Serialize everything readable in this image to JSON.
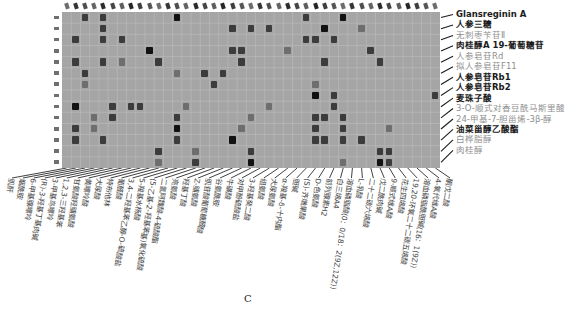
{
  "panel_label": "C",
  "chart_data": {
    "type": "heatmap",
    "title": "",
    "grid": true,
    "colors": {
      "plot_bg": "#a5a5a5",
      "grid_line": "#b9b9b9",
      "tick_mark": "#1f1f1f",
      "row_label_dark": "#1b1b1b",
      "row_label_gray": "#8f8f8f",
      "cell_intensity": {
        "1": "#6e6e6e",
        "2": "#3c3c3c",
        "3": "#121212"
      }
    },
    "rows": 14,
    "cols": 41,
    "row_labels": [
      {
        "text": "Glansreginin A",
        "shade": "dark"
      },
      {
        "text": "人参三糖",
        "shade": "dark"
      },
      {
        "text": "无刺枣苄苷Ⅱ",
        "shade": "gray"
      },
      {
        "text": "肉桂醇A 19-葡萄糖苷",
        "shade": "dark"
      },
      {
        "text": "人参皂苷Rd",
        "shade": "gray"
      },
      {
        "text": "拟人参皂苷F11",
        "shade": "gray"
      },
      {
        "text": "人参皂苷Rb1",
        "shade": "dark"
      },
      {
        "text": "人参皂苷Rb2",
        "shade": "dark"
      },
      {
        "text": "麦珠子酸",
        "shade": "dark"
      },
      {
        "text": "3-O-顺式对香豆酰马斯里酸",
        "shade": "gray"
      },
      {
        "text": "24-甲基-7-胆甾烯-3β-醇",
        "shade": "gray"
      },
      {
        "text": "油菜甾醇乙酸酯",
        "shade": "dark"
      },
      {
        "text": "白桦脂醇",
        "shade": "gray"
      },
      {
        "text": "肉桂醇",
        "shade": "gray"
      }
    ],
    "col_labels": [
      "肌酐",
      "烟酰胺",
      "6-甲基腺嘌呤",
      "(R)-3-羟基丁基肉碱",
      "3-甲基鸟嘌呤",
      "1,2,3-三羟基苯",
      "甘氨酸羟脯氨酸",
      "黄嘌呤酸",
      "犬尿酸",
      "特布他林",
      "葡醛酸",
      "3,4-二羟基苯乙醇-O-硫酸盐",
      "5-羧基水杨酸",
      "(5-乙基-2-羟基苯基)氧化硫酸",
      "二氢阿魏酸-4-硫酸酯",
      "亮氨酸",
      "羟基丁酸",
      "Z-脯氨酸",
      "肌苷酸葡萄糖醛酸",
      "谷氨酰胺",
      "牛磺酸",
      "对甲酚硫酸盐",
      "3-羟基癸二酸",
      "组氨酸",
      "犬尿氨酸",
      "α-羧基-δ-十内酯",
      "胆碱",
      "(S)-齐墩果酸",
      "D-色氨酸",
      "前列腺素H2",
      "白三烯A4",
      "溶血磷脂酸(0：0/18：2(9Z,12Z))",
      "L-乳酸",
      "二十二碳六烯酸",
      "戊二酰肉碱",
      "9-顺式维A酸",
      "花生四烯酸",
      "19,20-环氧二十二碳五烯酸",
      "溶血磷脂酰胆碱(16：1(9Z))",
      "4-氧代维A酸",
      "酮戊二酸"
    ],
    "cells": [
      [
        1,
        3,
        2
      ],
      [
        1,
        5,
        2
      ],
      [
        1,
        13,
        3
      ],
      [
        1,
        27,
        2
      ],
      [
        1,
        31,
        3
      ],
      [
        2,
        5,
        2
      ],
      [
        2,
        19,
        2
      ],
      [
        2,
        21,
        2
      ],
      [
        2,
        23,
        2
      ],
      [
        2,
        29,
        3
      ],
      [
        2,
        33,
        1
      ],
      [
        3,
        2,
        2
      ],
      [
        3,
        5,
        2
      ],
      [
        3,
        7,
        2
      ],
      [
        3,
        27,
        2
      ],
      [
        3,
        28,
        2
      ],
      [
        3,
        30,
        2
      ],
      [
        4,
        10,
        3
      ],
      [
        4,
        19,
        2
      ],
      [
        4,
        20,
        2
      ],
      [
        4,
        25,
        1
      ],
      [
        4,
        34,
        2
      ],
      [
        5,
        2,
        2
      ],
      [
        5,
        5,
        2
      ],
      [
        5,
        7,
        1
      ],
      [
        5,
        11,
        2
      ],
      [
        5,
        20,
        2
      ],
      [
        5,
        29,
        2
      ],
      [
        5,
        35,
        2
      ],
      [
        6,
        3,
        2
      ],
      [
        6,
        13,
        1
      ],
      [
        6,
        16,
        2
      ],
      [
        6,
        18,
        2
      ],
      [
        7,
        3,
        1
      ],
      [
        7,
        17,
        2
      ],
      [
        7,
        28,
        1
      ],
      [
        8,
        28,
        3
      ],
      [
        8,
        30,
        2
      ],
      [
        8,
        41,
        2
      ],
      [
        9,
        2,
        3
      ],
      [
        9,
        6,
        2
      ],
      [
        9,
        8,
        2
      ],
      [
        9,
        9,
        2
      ],
      [
        9,
        14,
        1
      ],
      [
        9,
        23,
        1
      ],
      [
        9,
        30,
        2
      ],
      [
        10,
        4,
        1
      ],
      [
        10,
        6,
        2
      ],
      [
        10,
        13,
        2
      ],
      [
        10,
        21,
        1
      ],
      [
        10,
        28,
        2
      ],
      [
        10,
        29,
        2
      ],
      [
        10,
        31,
        2
      ],
      [
        11,
        2,
        2
      ],
      [
        11,
        4,
        1
      ],
      [
        11,
        13,
        3
      ],
      [
        11,
        20,
        1
      ],
      [
        11,
        28,
        2
      ],
      [
        11,
        31,
        2
      ],
      [
        11,
        36,
        1
      ],
      [
        12,
        2,
        2
      ],
      [
        12,
        5,
        2
      ],
      [
        12,
        13,
        2
      ],
      [
        12,
        19,
        3
      ],
      [
        12,
        28,
        2
      ],
      [
        12,
        29,
        2
      ],
      [
        12,
        31,
        2
      ],
      [
        12,
        33,
        2
      ],
      [
        13,
        11,
        2
      ],
      [
        13,
        15,
        1
      ],
      [
        13,
        21,
        2
      ],
      [
        13,
        35,
        2
      ],
      [
        13,
        36,
        2
      ],
      [
        14,
        11,
        1
      ],
      [
        14,
        15,
        2
      ],
      [
        14,
        21,
        3
      ],
      [
        14,
        31,
        1
      ],
      [
        14,
        35,
        3
      ],
      [
        14,
        36,
        2
      ]
    ]
  }
}
